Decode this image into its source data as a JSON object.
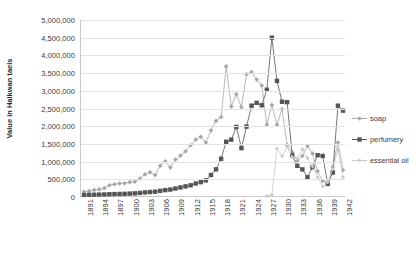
{
  "chart_data": {
    "type": "line",
    "title": "",
    "xlabel": "",
    "ylabel": "Value in Haikwan taels",
    "ylim": [
      0,
      5000000
    ],
    "ytick_labels": [
      "0",
      "500,000",
      "1,000,000",
      "1,500,000",
      "2,000,000",
      "2,500,000",
      "3,000,000",
      "3,500,000",
      "4,000,000",
      "4,500,000",
      "5,000,000"
    ],
    "ytick_values": [
      0,
      500000,
      1000000,
      1500000,
      2000000,
      2500000,
      3000000,
      3500000,
      4000000,
      4500000,
      5000000
    ],
    "grid": true,
    "legend_position": "right",
    "x": [
      1891,
      1892,
      1893,
      1894,
      1895,
      1896,
      1897,
      1898,
      1899,
      1900,
      1901,
      1902,
      1903,
      1904,
      1905,
      1906,
      1907,
      1908,
      1909,
      1910,
      1911,
      1912,
      1913,
      1914,
      1915,
      1916,
      1917,
      1918,
      1919,
      1920,
      1921,
      1922,
      1923,
      1924,
      1925,
      1926,
      1927,
      1928,
      1929,
      1930,
      1931,
      1932,
      1933,
      1934,
      1935,
      1936,
      1937,
      1938,
      1939,
      1940,
      1941,
      1942
    ],
    "xtick_labels": [
      "1891",
      "1894",
      "1897",
      "1900",
      "1903",
      "1906",
      "1909",
      "1912",
      "1915",
      "1918",
      "1921",
      "1924",
      "1927",
      "1930",
      "1933",
      "1936",
      "1939",
      "1942"
    ],
    "series": [
      {
        "name": "soap",
        "color": "#a6a6a6",
        "marker": "diamond",
        "values": [
          150000,
          170000,
          195000,
          215000,
          250000,
          330000,
          360000,
          380000,
          390000,
          420000,
          430000,
          520000,
          640000,
          700000,
          620000,
          880000,
          1010000,
          830000,
          1060000,
          1170000,
          1290000,
          1460000,
          1620000,
          1700000,
          1540000,
          1880000,
          2150000,
          2260000,
          3690000,
          2560000,
          2900000,
          2540000,
          3470000,
          3530000,
          3320000,
          3150000,
          2040000,
          2600000,
          2040000,
          2480000,
          1470000,
          1260000,
          1020000,
          1160000,
          1440000,
          1230000,
          730000,
          450000,
          380000,
          850000,
          1540000,
          760000
        ]
      },
      {
        "name": "perfumery",
        "color": "#555555",
        "marker": "square",
        "values": [
          60000,
          62000,
          65000,
          68000,
          72000,
          78000,
          82000,
          86000,
          90000,
          96000,
          102000,
          115000,
          130000,
          140000,
          150000,
          175000,
          195000,
          210000,
          240000,
          270000,
          300000,
          330000,
          380000,
          420000,
          470000,
          620000,
          780000,
          1080000,
          1560000,
          1620000,
          1980000,
          1380000,
          1990000,
          2580000,
          2660000,
          2590000,
          3030000,
          4500000,
          3280000,
          2690000,
          2680000,
          1180000,
          880000,
          780000,
          560000,
          840000,
          1180000,
          1160000,
          370000,
          690000,
          2580000,
          2440000
        ]
      },
      {
        "name": "essential oil",
        "color": "#c8c8c8",
        "marker": "diamond-small",
        "values": [
          null,
          null,
          null,
          null,
          null,
          null,
          null,
          null,
          null,
          null,
          null,
          null,
          null,
          null,
          null,
          null,
          null,
          null,
          null,
          null,
          null,
          null,
          null,
          null,
          null,
          null,
          null,
          null,
          null,
          null,
          null,
          null,
          null,
          null,
          null,
          null,
          30000,
          60000,
          1360000,
          1160000,
          1420000,
          1130000,
          1090000,
          1350000,
          1100000,
          870000,
          560000,
          300000,
          420000,
          790000,
          1340000,
          560000
        ]
      }
    ]
  },
  "legend": {
    "items": [
      {
        "label": "soap"
      },
      {
        "label": "perfumery"
      },
      {
        "label": "essential oil"
      }
    ]
  }
}
